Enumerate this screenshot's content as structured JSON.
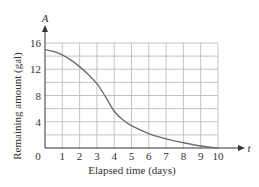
{
  "chart_data": {
    "type": "line",
    "title": "",
    "xlabel": "Elapsed time (days)",
    "ylabel": "Remaining amount (gal)",
    "x_axis_var": "t",
    "y_axis_var": "A",
    "xlim": [
      0,
      10
    ],
    "ylim": [
      0,
      16
    ],
    "x_ticks": [
      0,
      1,
      2,
      3,
      4,
      5,
      6,
      7,
      8,
      9,
      10
    ],
    "y_ticks": [
      4,
      8,
      12,
      16
    ],
    "y_grid_step": 2,
    "x_grid_step": 1,
    "grid": true,
    "legend": null,
    "series": [
      {
        "name": "Remaining amount",
        "x": [
          0,
          0.5,
          1,
          1.5,
          2,
          2.5,
          3,
          3.5,
          4,
          4.5,
          5,
          6,
          7,
          8,
          9,
          10
        ],
        "values": [
          15,
          14.7,
          14.2,
          13.4,
          12.4,
          11.2,
          9.8,
          7.8,
          5.6,
          4.3,
          3.4,
          2.2,
          1.4,
          0.8,
          0.3,
          0
        ]
      }
    ]
  },
  "labels": {
    "x_axis_var": "t",
    "y_axis_var": "A",
    "xlabel": "Elapsed time (days)",
    "ylabel": "Remaining amount (gal)",
    "origin": "0"
  },
  "colors": {
    "grid": "#bdbdbd",
    "axis": "#333333",
    "curve": "#6e6e6e",
    "text": "#333333"
  }
}
